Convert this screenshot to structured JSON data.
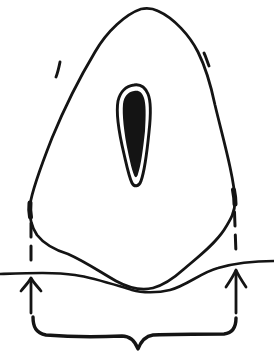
{
  "figure": {
    "name": "width-measurement-diagram",
    "colors": {
      "ink": "#141414",
      "paper": "#ffffff"
    },
    "canvas": {
      "width": 274,
      "height": 359
    },
    "shapes": {
      "body_outline": "M 141 9 C 126 14 107 31 95 52 C 83 72 66 104 52 138 C 41 166 32 190 30 205 C 29 216 31 226 37 235 C 44 244 55 250 68 254 C 86 262 100 272 116 281 C 127 287 141 291 153 288 C 164 285 174 278 184 269 C 198 257 214 245 224 230 C 231 219 235 212 235 201 C 235 191 233 181 230 167 C 226 148 220 126 215 105 C 211 86 206 68 198 52 C 190 36 174 18 158 11 C 152 8 146 8 141 9 Z",
      "core_ring": "M 134 85 C 126 86 120 92 118 101 C 116 112 119 133 124 154 C 127 167 129 177 132 183 C 134 187 139 187 141 181 C 145 170 147 152 149 132 C 151 114 151 101 148 94 C 145 87 140 84 134 85 Z",
      "core_fill": "M 134 91 C 128 92 124 96 123 104 C 122 114 124 133 128 152 C 130 162 132 170 134 175 C 135 178 137 178 138 174 C 141 165 143 150 145 131 C 146 115 146 104 144 98 C 142 92 139 90 134 91 Z",
      "left_accent_tick": "M 60 62 C 59 67 58 72 56 77",
      "right_accent_tick": "M 204 53 C 206 57 207 61 209 66",
      "soil_line": "M 0 274 C 30 273 55 272 75 275 C 95 278 115 285 132 290 C 142 293 158 293 170 290 C 186 286 202 272 218 268 C 235 263 252 261 274 261",
      "left_widest_mark": "M 30 203 C 29.5 208 29.5 212 30.5 217",
      "right_widest_mark": "M 233.5 190 C 234.5 195 235 199 235 204",
      "left_dashed_guide": "M 31 223 L 31 268",
      "right_dashed_guide": "M 234.5 212 L 236 254",
      "left_arrow_shaft": "M 31 313 L 31 279",
      "left_arrow_head": "M 21 291 C 25 286 29 282 31 278 C 33 282 37 286 41 291",
      "right_arrow_shaft": "M 236 313 L 236 271",
      "right_arrow_head": "M 226 287 C 230 281 234 275 236 270 C 238 275 242 281 246 287",
      "width_brace": "M 33 317 C 33 327 36 333 46 335 C 70 337 100 337 122 336 C 130 336 135 341 138 349 C 141 341 146 336 153 335 C 177 334 204 334 224 334 C 233 333 236 327 236 318"
    }
  }
}
